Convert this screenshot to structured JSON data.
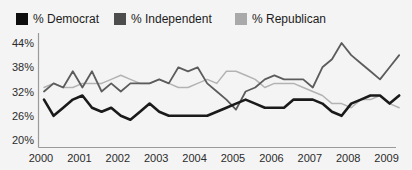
{
  "legend": {
    "items": [
      {
        "label": "% Democrat",
        "color": "#0d0d0d"
      },
      {
        "label": "% Independent",
        "color": "#4d4d4d"
      },
      {
        "label": "% Republican",
        "color": "#a9a9a9"
      }
    ]
  },
  "chart_data": {
    "type": "line",
    "title": "",
    "x_unit": "quarterly averages",
    "quarters": [
      "2000 Q1",
      "2000 Q2",
      "2000 Q3",
      "2000 Q4",
      "2001 Q1",
      "2001 Q2",
      "2001 Q3",
      "2001 Q4",
      "2002 Q1",
      "2002 Q2",
      "2002 Q3",
      "2002 Q4",
      "2003 Q1",
      "2003 Q2",
      "2003 Q3",
      "2003 Q4",
      "2004 Q1",
      "2004 Q2",
      "2004 Q3",
      "2004 Q4",
      "2005 Q1",
      "2005 Q2",
      "2005 Q3",
      "2005 Q4",
      "2006 Q1",
      "2006 Q2",
      "2006 Q3",
      "2006 Q4",
      "2007 Q1",
      "2007 Q2",
      "2007 Q3",
      "2007 Q4",
      "2008 Q1",
      "2008 Q2",
      "2008 Q3",
      "2008 Q4",
      "2009 Q1",
      "2009 Q2"
    ],
    "series": [
      {
        "name": "% Democrat",
        "color": "#1a1a1a",
        "stroke_width": 2.6,
        "values": [
          30,
          26,
          28,
          30,
          31,
          28,
          27,
          28,
          26,
          25,
          27,
          29,
          27,
          26,
          26,
          26,
          26,
          26,
          27,
          28,
          29,
          30,
          29,
          28,
          28,
          28,
          30,
          30,
          30,
          29,
          27,
          26,
          29,
          30,
          31,
          31,
          29,
          31
        ]
      },
      {
        "name": "% Independent",
        "color": "#5c5c5c",
        "stroke_width": 1.8,
        "values": [
          32,
          34,
          33,
          37,
          33,
          37,
          32,
          34,
          32,
          34,
          34,
          34,
          35,
          34,
          38,
          37,
          38,
          34,
          32,
          30,
          27.5,
          32,
          33,
          35,
          36,
          35,
          35,
          35,
          33,
          38,
          40,
          44,
          41,
          39,
          37,
          35,
          38,
          41
        ]
      },
      {
        "name": "% Republican",
        "color": "#b3b3b3",
        "stroke_width": 1.5,
        "values": [
          33,
          34,
          33,
          33,
          34,
          34,
          34,
          35,
          36,
          35,
          34,
          34,
          35,
          34,
          33,
          33,
          34,
          35,
          34,
          37,
          37,
          36,
          35,
          33,
          34,
          34,
          34,
          33,
          32,
          31,
          29,
          29,
          28,
          30,
          30,
          31,
          29,
          28
        ]
      }
    ],
    "yticks": [
      {
        "value": 44,
        "label": "44%"
      },
      {
        "value": 38,
        "label": "38%"
      },
      {
        "value": 32,
        "label": "32%"
      },
      {
        "value": 26,
        "label": "26%"
      },
      {
        "value": 20,
        "label": "20%"
      }
    ],
    "xticks": [
      {
        "value": 2000,
        "label": "2000"
      },
      {
        "value": 2001,
        "label": "2001"
      },
      {
        "value": 2002,
        "label": "2002"
      },
      {
        "value": 2003,
        "label": "2003"
      },
      {
        "value": 2004,
        "label": "2004"
      },
      {
        "value": 2005,
        "label": "2005"
      },
      {
        "value": 2006,
        "label": "2006"
      },
      {
        "value": 2007,
        "label": "2007"
      },
      {
        "value": 2008,
        "label": "2008"
      },
      {
        "value": 2009,
        "label": "2009"
      }
    ],
    "ylim": [
      20,
      44
    ],
    "xlabel": "",
    "ylabel": "",
    "grid": false,
    "legend_position": "top"
  }
}
